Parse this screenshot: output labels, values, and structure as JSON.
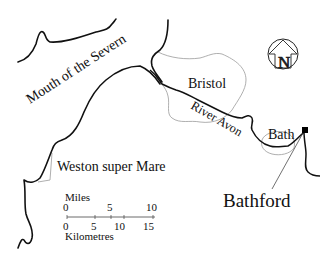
{
  "map": {
    "labels": {
      "sea": "Mouth of the Severn",
      "bristol": "Bristol",
      "river": "River Avon",
      "bath": "Bath",
      "weston": "Weston super Mare",
      "bathford": "Bathford"
    },
    "north_arrow": {
      "letter": "N"
    },
    "scale_bar": {
      "miles_label": "Miles",
      "miles_ticks": [
        "0",
        "5",
        "10"
      ],
      "km_ticks": [
        "0",
        "5",
        "10",
        "15"
      ],
      "km_label": "Kilometres"
    },
    "colors": {
      "coastline": "#111111",
      "boundary": "#9a9a9a",
      "marker": "#000000"
    }
  }
}
